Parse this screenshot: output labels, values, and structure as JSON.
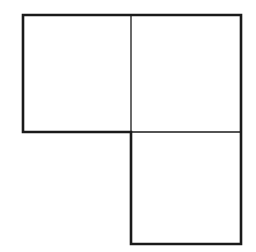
{
  "diagram": {
    "shape_count": 3,
    "stroke_color": "#1a1a1a",
    "background": "#ffffff",
    "outer_stroke_width": 2.6,
    "inner_stroke_width": 1.3,
    "squares": [
      {
        "id": "top-left",
        "x": 23,
        "y": 15,
        "size": 108
      },
      {
        "id": "top-right",
        "x": 131,
        "y": 15,
        "size": 110
      },
      {
        "id": "bottom-right",
        "x": 131,
        "y": 132,
        "size": 110
      }
    ],
    "outline_points": "23,15 241,15 241,244 131,244 131,132 23,132",
    "inner_lines": [
      {
        "x1": 131,
        "y1": 15,
        "x2": 131,
        "y2": 132
      },
      {
        "x1": 131,
        "y1": 132,
        "x2": 241,
        "y2": 132
      }
    ]
  }
}
